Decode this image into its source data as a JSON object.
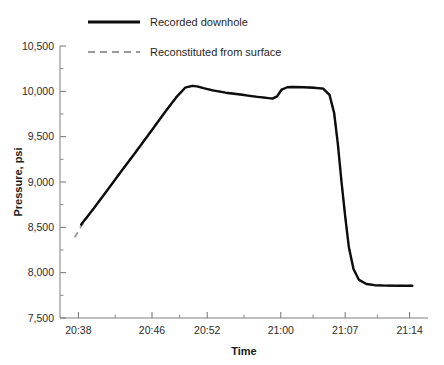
{
  "chart_data": {
    "type": "line",
    "title": "",
    "xlabel": "Time",
    "ylabel": "Pressure, psi",
    "grid": false,
    "legend_position": "top-center",
    "ylim": [
      7500,
      10500
    ],
    "ytick_labels": [
      "10,500",
      "10,000",
      "9,500",
      "9,000",
      "8,500",
      "8,000",
      "7,500"
    ],
    "ytick_values": [
      10500,
      10000,
      9500,
      9000,
      8500,
      8000,
      7500
    ],
    "yminor_step": 250,
    "xtick_labels": [
      "20:38",
      "20:46",
      "20:52",
      "21:00",
      "21:07",
      "21:14"
    ],
    "xlim_minutes": [
      1236,
      1276
    ],
    "xtick_minutes": [
      1238,
      1246,
      1252,
      1260,
      1267,
      1274
    ],
    "series": [
      {
        "name": "Recorded downhole",
        "style": "solid",
        "color": "#0d0d0d",
        "x": [
          1238.3,
          1239.6,
          1241.0,
          1242.6,
          1244.3,
          1245.9,
          1247.4,
          1248.6,
          1249.6,
          1250.4,
          1250.9,
          1251.6,
          1252.6,
          1254.0,
          1255.6,
          1257.0,
          1258.2,
          1259.1,
          1259.6,
          1260.1,
          1260.7,
          1261.4,
          1262.5,
          1263.6,
          1264.6,
          1265.3,
          1265.8,
          1266.2,
          1266.6,
          1267.0,
          1267.4,
          1267.9,
          1268.5,
          1269.3,
          1270.2,
          1271.4,
          1272.9,
          1274.3
        ],
        "y": [
          8530,
          8700,
          8890,
          9110,
          9340,
          9560,
          9770,
          9930,
          10040,
          10060,
          10055,
          10035,
          10010,
          9985,
          9965,
          9945,
          9930,
          9920,
          9945,
          10020,
          10045,
          10048,
          10045,
          10040,
          10030,
          9960,
          9760,
          9420,
          9000,
          8620,
          8280,
          8040,
          7920,
          7875,
          7862,
          7857,
          7855,
          7855
        ]
      },
      {
        "name": "Reconstituted from surface",
        "style": "dashed",
        "color": "#9a9a9a",
        "x": [
          1237.6,
          1238.6,
          1239.8,
          1241.2,
          1242.8,
          1244.4,
          1246.0,
          1247.5,
          1248.7,
          1249.7,
          1250.4,
          1250.9,
          1251.6,
          1252.6,
          1254.0,
          1255.6,
          1257.0,
          1258.2,
          1259.1,
          1259.6,
          1260.1,
          1260.7,
          1261.4,
          1262.5,
          1263.6,
          1264.6,
          1265.3,
          1265.8,
          1266.2,
          1266.6,
          1267.0,
          1267.4,
          1267.9,
          1268.5,
          1269.3,
          1270.2,
          1271.4,
          1272.9,
          1274.3
        ],
        "y": [
          8390,
          8560,
          8730,
          8920,
          9135,
          9360,
          9580,
          9785,
          9940,
          10045,
          10062,
          10055,
          10035,
          10012,
          9987,
          9967,
          9947,
          9932,
          9922,
          9947,
          10022,
          10047,
          10050,
          10047,
          10042,
          10032,
          9962,
          9762,
          9422,
          9002,
          8622,
          8282,
          8042,
          7922,
          7877,
          7864,
          7859,
          7857,
          7857
        ]
      }
    ]
  },
  "legend": {
    "items": [
      {
        "label": "Recorded downhole",
        "style": "solid",
        "color": "#0d0d0d"
      },
      {
        "label": "Reconstituted from surface",
        "style": "dashed",
        "color": "#9a9a9a"
      }
    ]
  },
  "axes": {
    "x_title": "Time",
    "y_title": "Pressure, psi"
  }
}
